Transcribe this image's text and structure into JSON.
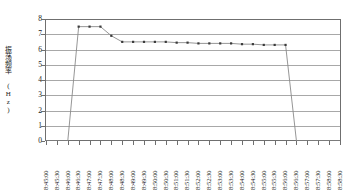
{
  "chart_data": {
    "type": "line",
    "title": "",
    "xlabel": "",
    "ylabel": "振荡频率 (Hz)",
    "ylim": [
      0,
      8
    ],
    "ytick_values": [
      0,
      1,
      2,
      3,
      4,
      5,
      6,
      7,
      8
    ],
    "grid": true,
    "legend": "none",
    "marker": "square",
    "line_color": "#8a8a8a",
    "marker_color": "#3a3a3a",
    "frame_color": "#6f6f6f",
    "grid_color": "#a8a8a8",
    "categories": [
      "8:45:00",
      "8:45:30",
      "8:46:00",
      "8:46:30",
      "8:47:00",
      "8:47:30",
      "8:48:00",
      "8:48:30",
      "8:49:00",
      "8:49:30",
      "8:50:00",
      "8:50:30",
      "8:51:00",
      "8:51:30",
      "8:52:00",
      "8:52:30",
      "8:53:00",
      "8:53:30",
      "8:54:00",
      "8:54:30",
      "8:55:00",
      "8:55:30",
      "8:56:00",
      "8:56:30",
      "8:57:00",
      "8:57:30",
      "8:58:00",
      "8:58:30"
    ],
    "values": [
      0,
      0,
      0,
      7.5,
      7.5,
      7.5,
      6.9,
      6.5,
      6.5,
      6.5,
      6.5,
      6.5,
      6.45,
      6.45,
      6.4,
      6.4,
      6.4,
      6.4,
      6.35,
      6.35,
      6.3,
      6.3,
      6.3,
      0,
      0,
      0,
      0,
      0
    ]
  }
}
